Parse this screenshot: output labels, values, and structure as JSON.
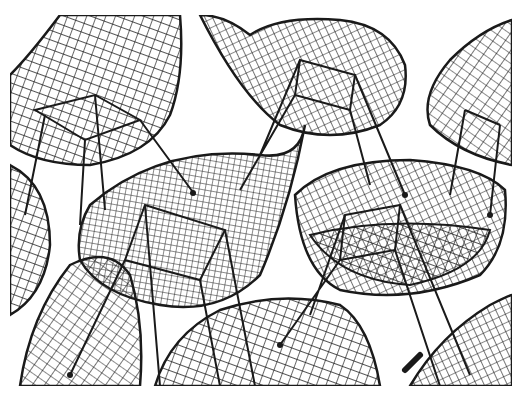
{
  "image": {
    "description": "Black and white photograph of overlapping wire-mesh shell chairs with dowel/rod legs",
    "alt": "Wire mesh chairs",
    "stroke_color": "#1a1a1a",
    "background_color": "#ffffff"
  }
}
